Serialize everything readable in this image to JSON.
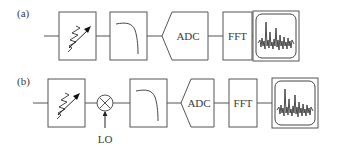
{
  "diagram": {
    "panels": [
      {
        "label": "(a)",
        "blocks": [
          {
            "type": "attenuator",
            "name": "variable attenuator"
          },
          {
            "type": "lowpass-filter",
            "name": "low-pass filter"
          },
          {
            "type": "adc",
            "label": "ADC"
          },
          {
            "type": "fft",
            "label": "FFT"
          },
          {
            "type": "display",
            "name": "spectrum display"
          }
        ]
      },
      {
        "label": "(b)",
        "blocks": [
          {
            "type": "attenuator",
            "name": "variable attenuator"
          },
          {
            "type": "mixer",
            "name": "mixer",
            "input_label": "LO"
          },
          {
            "type": "lowpass-filter",
            "name": "low-pass filter"
          },
          {
            "type": "adc",
            "label": "ADC"
          },
          {
            "type": "fft",
            "label": "FFT"
          },
          {
            "type": "display",
            "name": "spectrum display"
          }
        ]
      }
    ]
  }
}
